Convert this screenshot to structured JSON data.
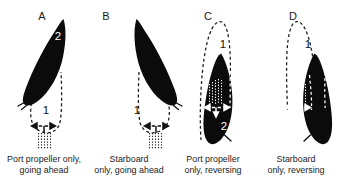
{
  "figure": {
    "background_color": "#ffffff",
    "hull_color": "#0b0b0b",
    "track_color_light": "#ffffff",
    "track_color_dark": "#1a1a1a"
  },
  "panels": [
    {
      "letter": "A",
      "caption_line1": "Port propeller only,",
      "caption_line2": "going ahead",
      "path_label_outer": "1",
      "path_label_inner": "2",
      "mode": "ahead",
      "side": "port"
    },
    {
      "letter": "B",
      "caption_line1": "Starboard",
      "caption_line2": "only, going ahead",
      "path_label_outer": "1",
      "path_label_inner": "2",
      "mode": "ahead",
      "side": "starboard"
    },
    {
      "letter": "C",
      "caption_line1": "Port propeller",
      "caption_line2": "only, reversing",
      "path_label_outer": "1",
      "path_label_inner": "2",
      "mode": "reversing",
      "side": "port"
    },
    {
      "letter": "D",
      "caption_line1": "Starboard",
      "caption_line2": "only, reversing",
      "path_label_outer": "1",
      "path_label_inner": "2",
      "mode": "reversing",
      "side": "starboard"
    }
  ]
}
